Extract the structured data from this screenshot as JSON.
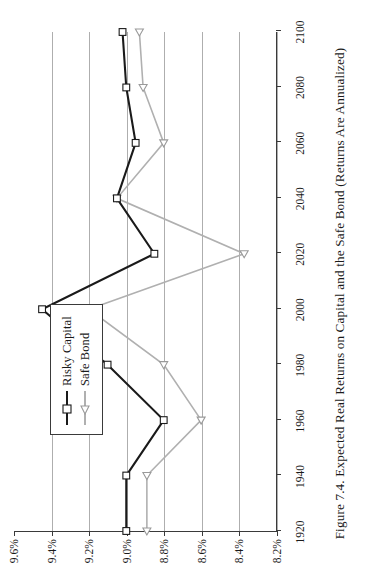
{
  "figure": {
    "caption": "Figure 7.4.  Expected Real Returns on Capital and the Safe Bond (Returns Are Annualized)"
  },
  "legend": {
    "position": "inside-top-left",
    "items": [
      {
        "label": "Risky Capital",
        "marker": "square-marker-icon",
        "color": "#1a1a1a"
      },
      {
        "label": "Safe Bond",
        "marker": "triangle-marker-icon",
        "color": "#b0b0b0"
      }
    ]
  },
  "chart_data": {
    "type": "line",
    "title": "Figure 7.4.  Expected Real Returns on Capital and the Safe Bond (Returns Are Annualized)",
    "xlabel": "",
    "ylabel": "",
    "grid": true,
    "x": [
      1920,
      1940,
      1960,
      1980,
      2000,
      2020,
      2040,
      2060,
      2080,
      2100
    ],
    "xtick_labels": [
      "1920",
      "1940",
      "1960",
      "1980",
      "2000",
      "2020",
      "2040",
      "2060",
      "2080",
      "2100"
    ],
    "ytick_labels": [
      "9.6%",
      "9.4%",
      "9.2%",
      "9.0%",
      "8.8%",
      "8.6%",
      "8.4%",
      "8.2%"
    ],
    "ytick_values": [
      9.6,
      9.4,
      9.2,
      9.0,
      8.8,
      8.6,
      8.4,
      8.2
    ],
    "ylim": [
      8.2,
      9.6
    ],
    "y_inverted": false,
    "series": [
      {
        "name": "Risky Capital",
        "color": "#1a1a1a",
        "marker": "square",
        "values": [
          9.0,
          9.0,
          8.8,
          9.1,
          9.45,
          8.85,
          9.05,
          8.95,
          9.0,
          9.02
        ]
      },
      {
        "name": "Safe Bond",
        "color": "#b0b0b0",
        "marker": "triangle",
        "values": [
          8.89,
          8.89,
          8.6,
          8.8,
          9.2,
          8.37,
          9.05,
          8.8,
          8.91,
          8.93
        ]
      }
    ]
  }
}
